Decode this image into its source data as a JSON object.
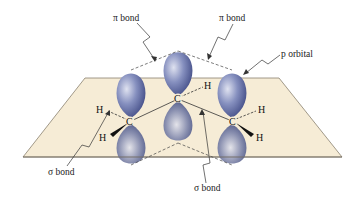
{
  "diagram": {
    "labels": {
      "pi_bond_left": "π bond",
      "pi_bond_right": "π bond",
      "p_orbital": "p orbital",
      "sigma_bond_left": "σ bond",
      "sigma_bond_right": "σ bond"
    },
    "atoms": {
      "carbon_left": "C",
      "carbon_middle": "C",
      "carbon_right": "C",
      "h_left_1": "H",
      "h_left_2": "H",
      "h_middle": "H",
      "h_right_1": "H",
      "h_right_2": "H"
    },
    "colors": {
      "plane_fill": "#f6ecd6",
      "plane_stroke": "#8a8270",
      "lobe_light": "#c9cde4",
      "lobe_dark": "#3d4880",
      "line": "#333333"
    }
  }
}
